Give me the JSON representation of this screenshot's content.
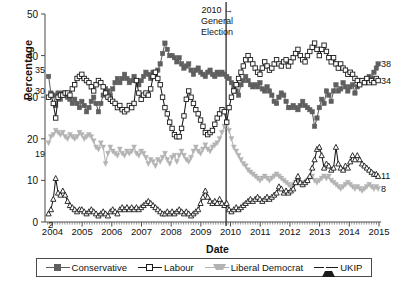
{
  "chart_data": {
    "type": "line",
    "title": "",
    "xlabel": "Date",
    "ylabel": "Percentage",
    "xlim": [
      2003.75,
      2015.0
    ],
    "ylim": [
      0,
      50
    ],
    "yticks": [
      0,
      10,
      20,
      30,
      40,
      50
    ],
    "xticks": [
      2004,
      2005,
      2006,
      2007,
      2008,
      2009,
      2010,
      2011,
      2012,
      2013,
      2014,
      2015
    ],
    "grid": false,
    "legend_position": "bottom",
    "annotations": [
      {
        "name": "general-election-marker",
        "lines": [
          "2010 →",
          "General",
          "Election"
        ],
        "x": 2009.85,
        "type": "vline"
      }
    ],
    "start_labels": [
      {
        "series": "Conservative",
        "value": 35
      },
      {
        "series": "Labour",
        "value": 30
      },
      {
        "series": "Liberal Democrat",
        "value": 19
      },
      {
        "series": "UKIP",
        "value": 2
      }
    ],
    "end_labels": [
      {
        "series": "Conservative",
        "value": 38
      },
      {
        "series": "Labour",
        "value": 34
      },
      {
        "series": "UKIP",
        "value": 11
      },
      {
        "series": "Liberal Democrat",
        "value": 8
      }
    ],
    "x": [
      2003.87,
      2003.95,
      2004.03,
      2004.11,
      2004.19,
      2004.27,
      2004.35,
      2004.43,
      2004.51,
      2004.59,
      2004.67,
      2004.75,
      2004.83,
      2004.91,
      2004.99,
      2005.07,
      2005.15,
      2005.23,
      2005.31,
      2005.39,
      2005.47,
      2005.55,
      2005.63,
      2005.71,
      2005.79,
      2005.87,
      2005.95,
      2006.03,
      2006.11,
      2006.19,
      2006.27,
      2006.35,
      2006.43,
      2006.51,
      2006.59,
      2006.67,
      2006.75,
      2006.83,
      2006.91,
      2006.99,
      2007.07,
      2007.15,
      2007.23,
      2007.31,
      2007.39,
      2007.47,
      2007.55,
      2007.63,
      2007.71,
      2007.79,
      2007.87,
      2007.95,
      2008.03,
      2008.11,
      2008.19,
      2008.27,
      2008.35,
      2008.43,
      2008.51,
      2008.59,
      2008.67,
      2008.75,
      2008.83,
      2008.91,
      2008.99,
      2009.07,
      2009.15,
      2009.23,
      2009.31,
      2009.39,
      2009.47,
      2009.55,
      2009.63,
      2009.71,
      2009.79,
      2009.87,
      2009.95,
      2010.03,
      2010.11,
      2010.19,
      2010.27,
      2010.35,
      2010.43,
      2010.51,
      2010.59,
      2010.67,
      2010.75,
      2010.83,
      2010.91,
      2010.99,
      2011.07,
      2011.15,
      2011.23,
      2011.31,
      2011.39,
      2011.47,
      2011.55,
      2011.63,
      2011.71,
      2011.79,
      2011.87,
      2011.95,
      2012.03,
      2012.11,
      2012.19,
      2012.27,
      2012.35,
      2012.43,
      2012.51,
      2012.59,
      2012.67,
      2012.75,
      2012.83,
      2012.91,
      2012.99,
      2013.07,
      2013.15,
      2013.23,
      2013.31,
      2013.39,
      2013.47,
      2013.55,
      2013.63,
      2013.71,
      2013.79,
      2013.87,
      2013.95,
      2014.03,
      2014.11,
      2014.19,
      2014.27,
      2014.35,
      2014.43,
      2014.51,
      2014.59,
      2014.67,
      2014.75,
      2014.83,
      2014.91,
      2014.97
    ],
    "series": [
      {
        "name": "Conservative",
        "color": "#5f5f5f",
        "marker": "filled-square",
        "values": [
          35,
          31,
          30.5,
          28,
          31,
          29.5,
          31,
          30.5,
          30,
          29.5,
          28.5,
          29.5,
          28.5,
          27.5,
          29,
          28,
          26.5,
          27.5,
          29,
          30,
          28.5,
          26.5,
          28.5,
          30.5,
          32,
          31.5,
          30.5,
          32,
          33.5,
          34.5,
          33.5,
          34.5,
          35.5,
          34.5,
          33.5,
          34,
          35,
          34,
          33,
          34,
          35,
          36,
          35.5,
          34.5,
          36,
          35.5,
          36.5,
          38,
          40.5,
          43,
          41.5,
          40,
          40,
          39.5,
          38.5,
          39.5,
          38,
          37,
          37.5,
          38,
          36.5,
          35.5,
          36.5,
          37,
          36,
          35.5,
          35,
          36,
          36.5,
          35.5,
          35,
          36,
          35.5,
          36,
          35.5,
          35,
          34.5,
          33.5,
          32.5,
          31.5,
          30.5,
          33,
          34,
          35,
          34,
          33,
          32.5,
          33,
          32.5,
          33.5,
          32,
          31.5,
          32.5,
          31.5,
          30.5,
          29,
          28.5,
          30,
          31,
          30.5,
          29,
          27.5,
          27.5,
          28,
          27.5,
          27,
          28,
          29,
          28,
          27.5,
          27,
          26.5,
          23,
          25,
          27.5,
          29.5,
          28.5,
          31.5,
          30.5,
          29,
          31.5,
          33,
          31.5,
          32,
          33.5,
          32.5,
          31.5,
          32.5,
          33,
          31,
          32.5,
          33.5,
          34,
          33.5,
          34.5,
          35,
          34.5,
          36,
          37,
          38
        ]
      },
      {
        "name": "Labour",
        "color": "#1a1a1a",
        "marker": "open-square",
        "values": [
          30,
          30.5,
          28.5,
          25,
          30,
          30.5,
          30.5,
          31,
          31,
          30.5,
          32,
          33,
          34.5,
          35,
          35.5,
          34.5,
          34,
          33.5,
          32.5,
          31.5,
          33,
          34,
          33.5,
          32.5,
          31,
          30,
          29.5,
          29,
          28.5,
          27.5,
          28,
          27,
          26.5,
          27,
          28,
          27.5,
          28.5,
          34,
          31,
          29.5,
          30.5,
          31,
          30.5,
          32,
          35,
          36,
          34.5,
          33,
          30,
          27.5,
          26,
          24,
          22.5,
          21,
          20.5,
          20.5,
          22.5,
          25.5,
          29.5,
          31.5,
          30,
          28.5,
          27,
          26,
          24.5,
          23,
          21.5,
          21,
          21.5,
          22,
          23.5,
          25,
          26,
          27,
          26.5,
          24,
          27.5,
          30,
          31.5,
          33,
          34.5,
          36,
          37.5,
          39,
          40,
          39,
          38,
          37,
          36,
          35.5,
          37,
          38.5,
          37.5,
          36.5,
          37,
          38,
          39,
          38,
          37.5,
          38.5,
          39,
          37.5,
          38.5,
          39.5,
          40.5,
          41.5,
          40,
          39,
          38.5,
          40,
          41,
          42,
          43,
          41.5,
          40,
          41.5,
          42.5,
          41,
          39.5,
          38.5,
          39.5,
          38,
          37,
          38,
          37,
          36.5,
          35.5,
          36,
          35.5,
          34.5,
          34,
          33,
          34,
          33.5,
          34.5,
          33.5,
          34,
          33.5,
          34.5,
          34
        ]
      },
      {
        "name": "Liberal Democrat",
        "color": "#b3b3b3",
        "marker": "filled-triangle-down",
        "values": [
          19,
          20.5,
          21,
          22,
          21.5,
          21,
          21.5,
          20.5,
          20,
          21,
          20.5,
          20,
          20.5,
          21.5,
          21,
          20,
          20.5,
          21,
          20.5,
          19.5,
          18,
          17.5,
          19,
          18,
          14,
          16.5,
          18,
          17,
          16.5,
          16,
          17.5,
          16.5,
          16,
          17,
          16.5,
          17,
          18,
          16.5,
          16,
          17,
          16.5,
          15.5,
          14,
          15,
          14.5,
          13.5,
          15,
          14.5,
          15.5,
          16.5,
          15,
          14,
          15.5,
          16,
          14.5,
          16,
          17,
          16,
          15,
          14.5,
          15.5,
          17,
          18,
          17,
          16.5,
          17.5,
          18.5,
          17.5,
          17,
          18,
          18.5,
          19,
          20,
          21.5,
          23,
          24,
          22,
          20,
          18,
          17,
          16,
          15,
          14,
          13.5,
          12.5,
          12,
          11.5,
          11,
          10.5,
          10,
          10.5,
          11,
          10.5,
          10,
          10.5,
          11,
          11.5,
          11,
          10.5,
          10,
          9.5,
          9,
          8.5,
          9,
          9.5,
          10,
          9.5,
          9,
          9.5,
          10,
          10.5,
          11,
          10,
          9.5,
          10,
          10.5,
          11,
          10.5,
          11,
          10,
          9.5,
          9,
          8.5,
          8,
          8.5,
          9,
          9.5,
          9,
          8.5,
          8,
          8.5,
          8,
          7.5,
          8,
          8.5,
          9,
          8.5,
          8,
          8.5,
          8
        ]
      },
      {
        "name": "UKIP",
        "color": "#1a1a1a",
        "marker": "open-triangle-up",
        "values": [
          2,
          3,
          5.5,
          10.5,
          7,
          6.5,
          7.5,
          6.5,
          5,
          4,
          3.5,
          3,
          2.5,
          3,
          3,
          2.5,
          2,
          2.5,
          3,
          2.5,
          2,
          1.5,
          2,
          2.5,
          2,
          1.5,
          2.5,
          3,
          2.5,
          2,
          3,
          3.5,
          3,
          3.5,
          3,
          3.5,
          3,
          3.5,
          3,
          3.5,
          4,
          4.5,
          5,
          4.5,
          4,
          3.5,
          3,
          2.5,
          2,
          2,
          2.5,
          2,
          2.5,
          2,
          2.5,
          3,
          2.5,
          2,
          2.5,
          2,
          1.5,
          2,
          2.5,
          3,
          4.5,
          6,
          7.5,
          6,
          5,
          4.5,
          5,
          4.5,
          5.5,
          4.5,
          4,
          4.5,
          3,
          2.5,
          3,
          3.5,
          3,
          3.5,
          4,
          4.5,
          5,
          5.5,
          5,
          5.5,
          6,
          5.5,
          5,
          5.5,
          6,
          5.5,
          6,
          6.5,
          7,
          8.5,
          8,
          7,
          7.5,
          7,
          7.5,
          8,
          9.5,
          11,
          9.5,
          9,
          9.5,
          10,
          11,
          13,
          15,
          17.5,
          18,
          16,
          13,
          14,
          13.5,
          12.5,
          13,
          18,
          14,
          13,
          12.5,
          13.5,
          13,
          14.5,
          16,
          15,
          16,
          15,
          14,
          13.5,
          13,
          12.5,
          12,
          11.5,
          11.5,
          11
        ]
      }
    ]
  },
  "axis": {
    "ylabel": "Percentage",
    "xlabel": "Date",
    "yticks": [
      "0",
      "10",
      "20",
      "30",
      "40",
      "50"
    ],
    "xticks": [
      "2004",
      "2005",
      "2006",
      "2007",
      "2008",
      "2009",
      "2010",
      "2011",
      "2012",
      "2013",
      "2014",
      "2015"
    ]
  },
  "annotation": {
    "line1": "2010 →",
    "line2": "General",
    "line3": "Election"
  },
  "endpoints": {
    "conservative": "38",
    "labour": "34",
    "ukip": "11",
    "libdem": "8"
  },
  "startpoints": {
    "conservative": "35",
    "labour": "30",
    "libdem": "19",
    "ukip": "2"
  },
  "legend": {
    "items": [
      {
        "label": "Conservative",
        "marker": "filled-square",
        "color": "#5f5f5f"
      },
      {
        "label": "Labour",
        "marker": "open-square",
        "color": "#1a1a1a"
      },
      {
        "label": "Liberal Democrat",
        "marker": "filled-triangle-down",
        "color": "#b3b3b3"
      },
      {
        "label": "UKIP",
        "marker": "open-triangle-up",
        "color": "#1a1a1a"
      }
    ]
  }
}
